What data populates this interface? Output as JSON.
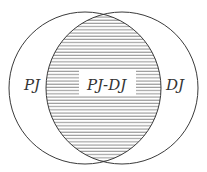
{
  "diagram": {
    "type": "venn",
    "sets": [
      {
        "id": "left",
        "label": "PJ",
        "cx": 85,
        "cy": 88,
        "r": 76
      },
      {
        "id": "right",
        "label": "DJ",
        "cx": 122,
        "cy": 88,
        "r": 76
      }
    ],
    "intersection": {
      "label": "PJ-DJ",
      "fill_pattern": "horizontal-hatch",
      "hatch_color": "#8a8a8a",
      "hatch_spacing": 3.2
    },
    "labels": {
      "left": "PJ",
      "center": "PJ-DJ",
      "right": "DJ"
    },
    "colors": {
      "stroke": "#3a3a3a",
      "background": "#ffffff",
      "text": "#333333"
    }
  }
}
